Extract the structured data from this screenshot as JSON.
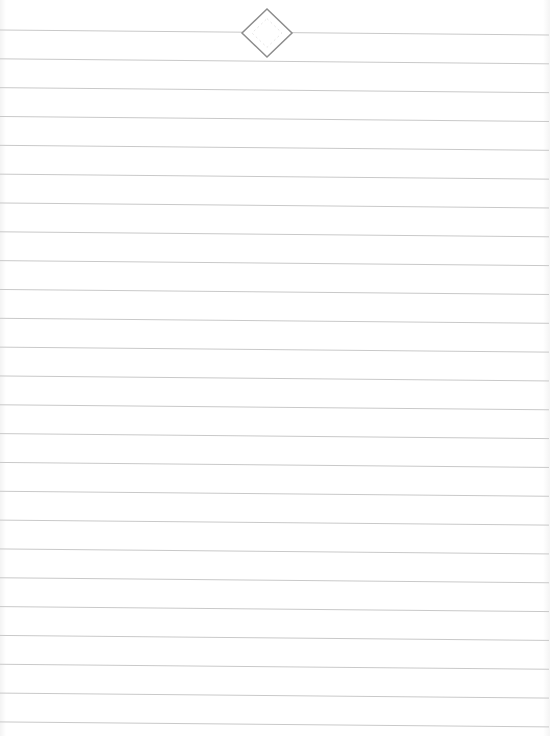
{
  "page": {
    "type": "lined-notepaper",
    "background_color": "#ffffff",
    "line_color": "#c9c9c9",
    "line_count": 25,
    "first_line_y_left": 30,
    "first_line_y_right": 35,
    "line_spacing": 28.83,
    "line_start_x": 0,
    "line_end_x": 549
  },
  "emblem": {
    "shape": "diamond",
    "icon": "diamond-ornament-icon",
    "center_x": 267,
    "center_y": 33,
    "half_width": 25,
    "half_height": 24,
    "stroke_color": "#8c8c8c",
    "inner_pattern_color": "#e6e6e6",
    "gap_left_x": 242,
    "gap_right_x": 292
  }
}
